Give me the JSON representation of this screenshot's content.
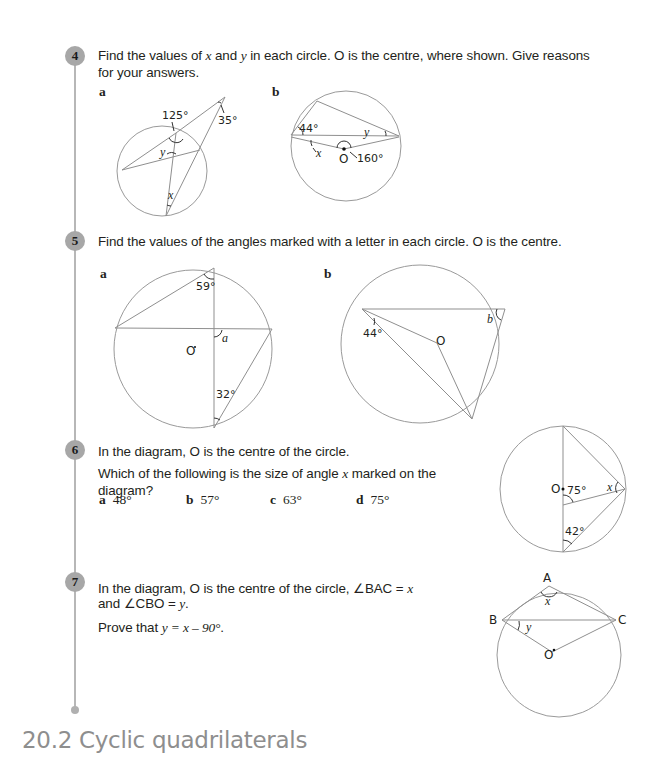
{
  "section_heading": "20.2 Cyclic quadrilaterals",
  "questions": {
    "q4": {
      "number": "4",
      "text_line1_a": "Find the values of ",
      "var_x": "x",
      "text_line1_b": " and ",
      "var_y": "y",
      "text_line1_c": " in each circle. O is the centre, where shown. Give reasons",
      "text_line2": "for your answers.",
      "parts": {
        "a": {
          "label": "a",
          "angles": {
            "top": "125°",
            "ext": "35°",
            "x": "x",
            "y": "y"
          }
        },
        "b": {
          "label": "b",
          "angles": {
            "left": "44°",
            "centre": "160°",
            "x": "x",
            "y": "y",
            "centre_label": "O"
          }
        }
      }
    },
    "q5": {
      "number": "5",
      "text": "Find the values of the angles marked with a letter in each circle. O is the centre.",
      "parts": {
        "a": {
          "label": "a",
          "angles": {
            "top": "59°",
            "bottom": "32°",
            "a": "a",
            "centre_label": "O"
          }
        },
        "b": {
          "label": "b",
          "angles": {
            "left": "44°",
            "b": "b",
            "centre_label": "O"
          }
        }
      }
    },
    "q6": {
      "number": "6",
      "line1": "In the diagram, O is the centre of the circle.",
      "line2_a": "Which of the following is the size of angle ",
      "line2_var": "x",
      "line2_b": " marked on the",
      "line3": "diagram?",
      "choices": [
        {
          "letter": "a",
          "value": "48°"
        },
        {
          "letter": "b",
          "value": "57°"
        },
        {
          "letter": "c",
          "value": "63°"
        },
        {
          "letter": "d",
          "value": "75°"
        }
      ],
      "diagram": {
        "centre_label": "O",
        "angle1": "75°",
        "angle2": "42°",
        "x": "x"
      }
    },
    "q7": {
      "number": "7",
      "line1_a": "In the diagram, O is the centre of the circle, ∠BAC = ",
      "line1_var": "x",
      "line2_a": "and ∠CBO = ",
      "line2_var": "y",
      "line2_b": ".",
      "line3_a": "Prove that ",
      "line3_expr": "y = x – 90°",
      "line3_b": ".",
      "diagram": {
        "A": "A",
        "B": "B",
        "C": "C",
        "O": "O",
        "x": "x",
        "y": "y"
      }
    }
  }
}
